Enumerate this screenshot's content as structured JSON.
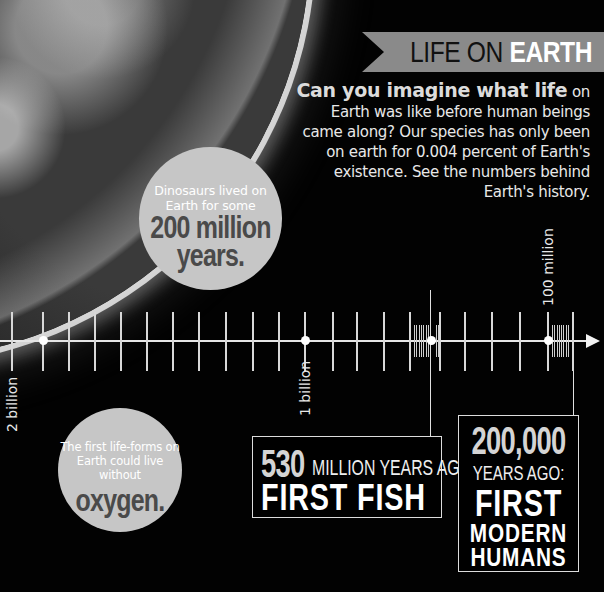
{
  "header": {
    "banner_light": "LIFE ON",
    "banner_bold": "EARTH",
    "banner_color": "#8a8a8a",
    "intro_lead": "Can you imagine what life",
    "intro_rest": "on Earth was like before human beings came along? Our species has only been on earth for 0.004 percent of Earth's existence. See the numbers behind Earth's history."
  },
  "image": {
    "subject": "earth-from-space"
  },
  "facts": {
    "dinosaurs": {
      "small": "Dinosaurs lived on Earth for some",
      "big1": "200 million",
      "big2": "years."
    },
    "oxygen": {
      "small": "The first life-forms on Earth could live without",
      "big": "oxygen."
    }
  },
  "timeline": {
    "labels": [
      {
        "text": "2 billion",
        "x": 12
      },
      {
        "text": "1 billion",
        "x": 305
      },
      {
        "text": "100 million",
        "x": 548
      }
    ],
    "major_ticks_x": [
      12,
      43,
      69,
      95,
      121,
      147,
      173,
      199,
      226,
      253,
      279,
      305,
      333,
      357,
      384,
      410,
      440,
      465,
      492,
      520,
      548,
      573
    ],
    "dots_x": [
      43,
      305,
      431,
      548
    ],
    "fine_tick_clusters": [
      {
        "from": 414,
        "to": 428,
        "count": 7
      },
      {
        "from": 436,
        "to": 438,
        "count": 2
      },
      {
        "from": 552,
        "to": 568,
        "count": 8
      }
    ],
    "markers": [
      {
        "x": 431,
        "label": "530 million years ago"
      },
      {
        "x": 573,
        "label": "200,000 years ago"
      }
    ]
  },
  "events": {
    "fish": {
      "number": "530",
      "sub": "MILLION YEARS AGO:",
      "title": "FIRST FISH"
    },
    "humans": {
      "number": "200,000",
      "sub": "YEARS AGO:",
      "title1": "FIRST",
      "title2": "MODERN",
      "title3": "HUMANS"
    }
  }
}
